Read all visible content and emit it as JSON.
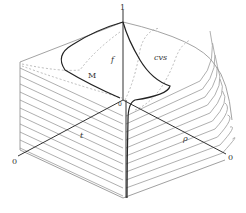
{
  "figure": {
    "type": "3d-surface-diagram",
    "colors": {
      "background": "#ffffff",
      "axis": "#333333",
      "contour": "#9a9a9a",
      "dashed": "#9a9a9a",
      "curve_main": "#222222"
    },
    "labels": {
      "top_axis_tick": "1",
      "curve_m": "M",
      "curve_f": "f",
      "curve_cvs": "cvs",
      "left_origin": "0",
      "right_origin": "0",
      "axis_rho": "ρ",
      "axis_t": "t",
      "inner_tick": "0"
    }
  }
}
